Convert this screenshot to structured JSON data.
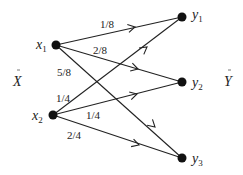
{
  "diagram": {
    "type": "bipartite channel transition diagram",
    "input_set_label": "X",
    "output_set_label": "Y",
    "inputs": [
      {
        "id": "x1",
        "label": "x",
        "sub": "1"
      },
      {
        "id": "x2",
        "label": "x",
        "sub": "2"
      }
    ],
    "outputs": [
      {
        "id": "y1",
        "label": "y",
        "sub": "1"
      },
      {
        "id": "y2",
        "label": "y",
        "sub": "2"
      },
      {
        "id": "y3",
        "label": "y",
        "sub": "3"
      }
    ],
    "edges": [
      {
        "from": "x1",
        "to": "y1",
        "prob": "1/8"
      },
      {
        "from": "x1",
        "to": "y2",
        "prob": "2/8"
      },
      {
        "from": "x1",
        "to": "y3",
        "prob": "5/8"
      },
      {
        "from": "x2",
        "to": "y1",
        "prob": "1/4"
      },
      {
        "from": "x2",
        "to": "y2",
        "prob": "1/4"
      },
      {
        "from": "x2",
        "to": "y3",
        "prob": "2/4"
      }
    ],
    "colors": {
      "stroke": "#222222",
      "node": "#111111",
      "background": "#ffffff"
    }
  }
}
